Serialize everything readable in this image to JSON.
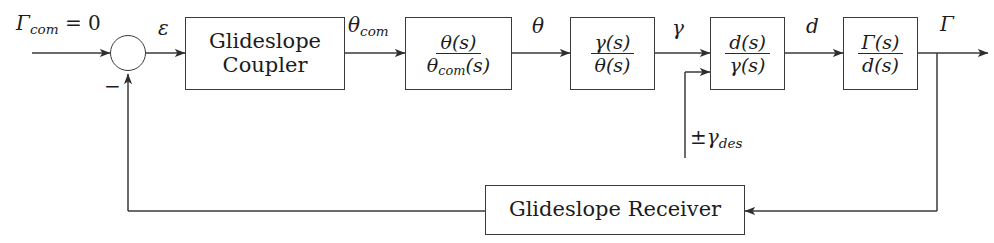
{
  "diagram": {
    "line_color": "#3a3a3a",
    "text_color": "#1c1c1c",
    "background": "#ffffff",
    "blocks": {
      "coupler": {
        "line1": "Glideslope",
        "line2": "Coupler"
      },
      "theta_tf": {
        "numerator": "θ(s)",
        "denominator_main": "θ",
        "denominator_sub": "com",
        "denominator_tail": "(s)"
      },
      "gamma_tf": {
        "numerator": "γ(s)",
        "denominator": "θ(s)"
      },
      "d_tf": {
        "numerator": "d(s)",
        "denominator": "γ(s)"
      },
      "gslope_tf": {
        "numerator": "Γ(s)",
        "denominator": "d(s)"
      },
      "receiver": {
        "label": "Glideslope Receiver"
      }
    },
    "signals": {
      "command": {
        "symbol": "Γ",
        "sub": "com",
        "equals": " = 0"
      },
      "error": "ε",
      "theta_com": {
        "symbol": "θ",
        "sub": "com"
      },
      "theta": "θ",
      "gamma": "γ",
      "d": "d",
      "gamma_out": "Γ",
      "gamma_des": {
        "prefix": "±",
        "symbol": "γ",
        "sub": "des"
      },
      "summing_negative": "−"
    }
  }
}
